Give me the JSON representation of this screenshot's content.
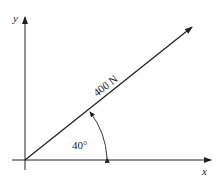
{
  "diagram": {
    "type": "force-vector",
    "axes": {
      "x_label": "x",
      "y_label": "y"
    },
    "vector": {
      "magnitude_label": "400 N",
      "angle_label": "40°",
      "angle_deg": 40,
      "reference": "positive x-axis"
    },
    "colors": {
      "line": "#222222",
      "background": "#ffffff"
    }
  }
}
